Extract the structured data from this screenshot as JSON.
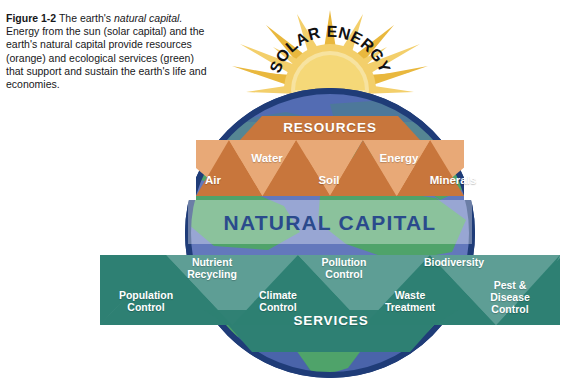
{
  "figure": {
    "number": "Figure 1-2",
    "title_plain_1": " The earth's ",
    "title_italic": "natural capital.",
    "body": " Energy from the sun (solar capital) and the earth's natural capital provide resources (orange) and ecological services (green) that support and sustain the earth's life and economies."
  },
  "diagram": {
    "sun_label": "SOLAR ENERGY",
    "resources_band_label": "RESOURCES",
    "natural_capital_label": "NATURAL CAPITAL",
    "services_band_label": "SERVICES",
    "resources": [
      {
        "label": "Air"
      },
      {
        "label": "Water"
      },
      {
        "label": "Soil"
      },
      {
        "label": "Energy"
      },
      {
        "label": "Minerals"
      }
    ],
    "services": [
      {
        "label": "Population\nControl"
      },
      {
        "label": "Nutrient\nRecycling"
      },
      {
        "label": "Climate\nControl"
      },
      {
        "label": "Pollution\nControl"
      },
      {
        "label": "Waste\nTreatment"
      },
      {
        "label": "Biodiversity"
      },
      {
        "label": "Pest &\nDisease\nControl"
      }
    ]
  },
  "colors": {
    "sun_ray": "#E9B83E",
    "sun_ray_light": "#F3CF6B",
    "sun_core": "#F7E3A0",
    "orange_dark": "#C8763C",
    "orange_light": "#E8A977",
    "teal_dark": "#2E8073",
    "teal_light": "#5E9E95",
    "globe_ocean": "#5B6FB5",
    "globe_land": "#4FA36A",
    "globe_ring": "#1F3C78",
    "band_overlay": "#FFFFFF",
    "natural_capital_text": "#2A4A8C",
    "caption_text": "#17171A",
    "page_background": "#FFFFFF"
  }
}
